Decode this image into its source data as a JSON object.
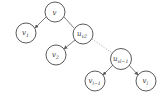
{
  "diagram": {
    "type": "tree",
    "nodes": [
      {
        "id": "v",
        "label": "v",
        "sub": "",
        "x": 55,
        "y": 12
      },
      {
        "id": "v1",
        "label": "v",
        "sub": "1",
        "x": 26,
        "y": 33
      },
      {
        "id": "uv2",
        "label": "u",
        "sub": "v2",
        "x": 83,
        "y": 34
      },
      {
        "id": "v2",
        "label": "v",
        "sub": "2",
        "x": 56,
        "y": 55
      },
      {
        "id": "uvl1",
        "label": "u",
        "sub": "vl−1",
        "x": 121,
        "y": 59
      },
      {
        "id": "vl1",
        "label": "v",
        "sub": "l−1",
        "x": 95,
        "y": 81
      },
      {
        "id": "vl",
        "label": "v",
        "sub": "l",
        "x": 146,
        "y": 81
      }
    ],
    "edges": [
      {
        "from": "v",
        "to": "v1",
        "style": "solid"
      },
      {
        "from": "v",
        "to": "uv2",
        "style": "solid"
      },
      {
        "from": "uv2",
        "to": "v2",
        "style": "solid"
      },
      {
        "from": "uv2",
        "to": "uvl1",
        "style": "dotted"
      },
      {
        "from": "uvl1",
        "to": "vl1",
        "style": "solid"
      },
      {
        "from": "uvl1",
        "to": "vl",
        "style": "solid"
      }
    ],
    "colors": {
      "stroke": "#5a5a5a",
      "dotted": "#9a9a9a",
      "text": "#333333",
      "background": "#ffffff"
    }
  }
}
